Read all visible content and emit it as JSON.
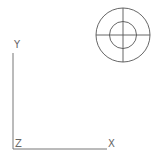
{
  "viewport": {
    "ucs_icon": {
      "x_label": "X",
      "y_label": "Y",
      "z_label": "Z"
    },
    "navigation_target": {
      "type": "crosshair-circle"
    },
    "colors": {
      "line": "#555555",
      "background": "#ffffff"
    }
  }
}
